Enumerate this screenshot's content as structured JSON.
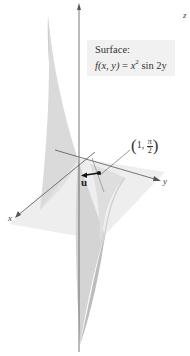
{
  "caption": {
    "heading": "Surface:",
    "func_lhs": "f(x, y)",
    "equals": " = ",
    "var": "x",
    "exponent": "2",
    "rest": " sin 2y"
  },
  "axes": {
    "x_label": "x",
    "y_label": "y",
    "z_label": "z"
  },
  "point": {
    "x_value": "1",
    "y_num": "π",
    "y_den": "2"
  },
  "vector": {
    "label": "u"
  },
  "colors": {
    "surface_light": "#e6e6e6",
    "surface_mid": "#cfcfcf",
    "surface_dark": "#b8b8b8",
    "plane": "#ececec",
    "axis": "#555555",
    "caption_bg": "#f1f1f1"
  }
}
